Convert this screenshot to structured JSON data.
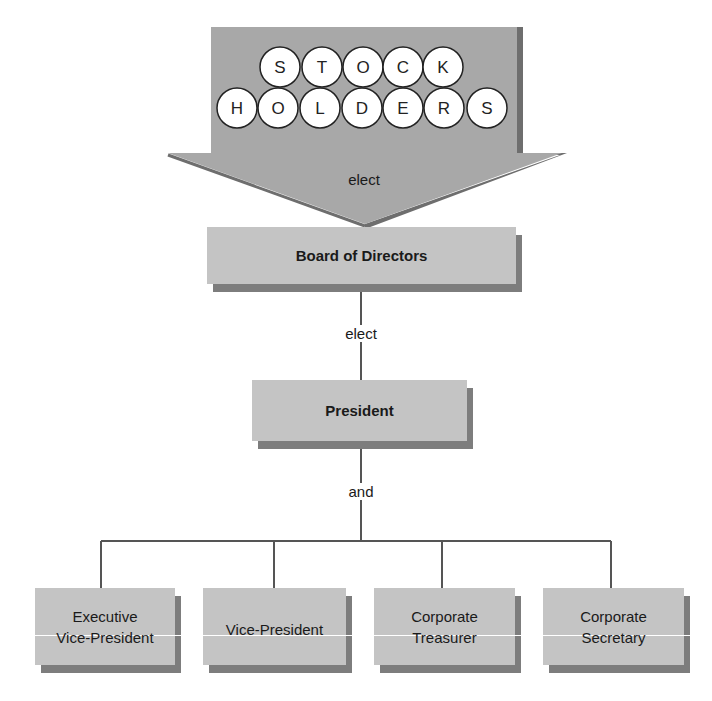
{
  "diagram": {
    "type": "organization-chart",
    "colors": {
      "arrow_fill": "#a8a8a8",
      "arrow_shadow": "#6e6e6e",
      "box_fill": "#c4c4c4",
      "box_shadow": "#7d7d7d",
      "line": "#555555",
      "circle_fill": "#ffffff"
    },
    "top_arrow": {
      "row1_letters": [
        "S",
        "T",
        "O",
        "C",
        "K"
      ],
      "row2_letters": [
        "H",
        "O",
        "L",
        "D",
        "E",
        "R",
        "S"
      ],
      "word": "STOCKHOLDERS",
      "label": "elect"
    },
    "nodes": {
      "board": "Board of Directors",
      "president": "President",
      "officers": [
        {
          "line1": "Executive",
          "line2": "Vice-President"
        },
        {
          "line1": "Vice-President",
          "line2": ""
        },
        {
          "line1": "Corporate",
          "line2": "Treasurer"
        },
        {
          "line1": "Corporate",
          "line2": "Secretary"
        }
      ]
    },
    "connectors": {
      "board_to_president": "elect",
      "president_to_officers": "and"
    }
  }
}
